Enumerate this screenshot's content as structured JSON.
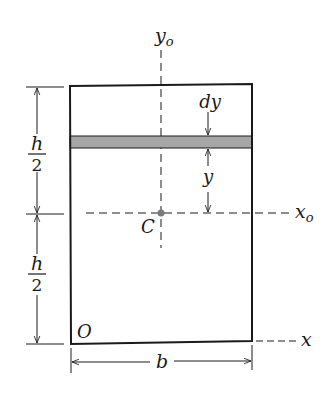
{
  "diagram": {
    "labels": {
      "y_axis_centroidal": "y",
      "y_axis_centroidal_sub": "o",
      "x_axis_centroidal": "x",
      "x_axis_centroidal_sub": "o",
      "x_axis": "x",
      "centroid": "C",
      "origin": "O",
      "width": "b",
      "strip_thickness": "dy",
      "strip_distance": "y",
      "half_height_num": "h",
      "half_height_den": "2"
    },
    "colors": {
      "stroke": "#1a1a1a",
      "strip_fill": "#a6a6a6",
      "centroid_dot": "#7a7a7a",
      "background": "#ffffff"
    }
  }
}
